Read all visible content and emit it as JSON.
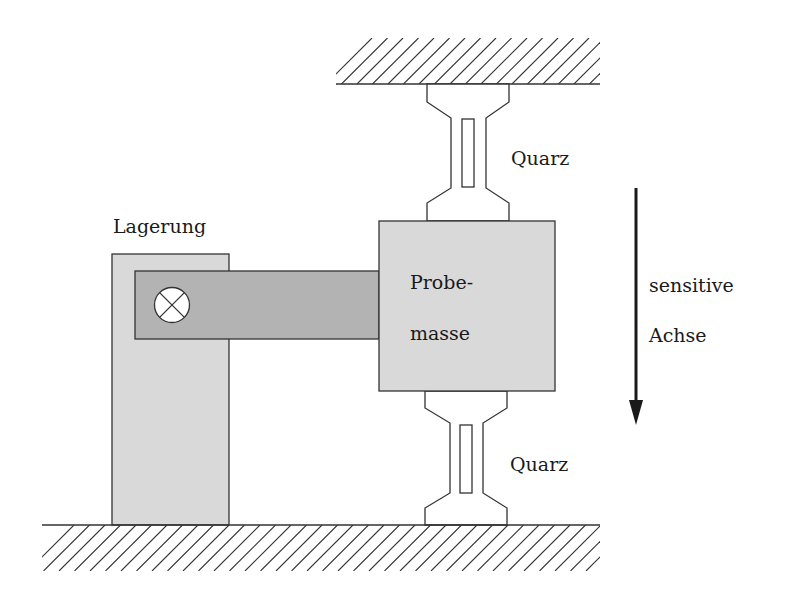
{
  "diagram": {
    "type": "mechanical-schematic",
    "labels": {
      "bearing": "Lagerung",
      "proof_mass_line1": "Probe-",
      "proof_mass_line2": "masse",
      "quartz_upper": "Quarz",
      "quartz_lower": "Quarz",
      "axis_line1": "sensitive",
      "axis_line2": "Achse"
    },
    "components": [
      {
        "id": "ceiling",
        "kind": "fixed-ground",
        "position": "top"
      },
      {
        "id": "floor",
        "kind": "fixed-ground",
        "position": "bottom"
      },
      {
        "id": "bearing",
        "label": "Lagerung",
        "kind": "support-block"
      },
      {
        "id": "pivot",
        "kind": "hinge",
        "symbol": "circle-with-x"
      },
      {
        "id": "arm",
        "kind": "pendulum-arm"
      },
      {
        "id": "proof-mass",
        "label": "Probemasse",
        "kind": "mass-block"
      },
      {
        "id": "quartz-upper",
        "label": "Quarz",
        "kind": "quartz-resonator"
      },
      {
        "id": "quartz-lower",
        "label": "Quarz",
        "kind": "quartz-resonator"
      },
      {
        "id": "sensitive-axis",
        "label": "sensitive Achse",
        "kind": "arrow",
        "direction": "down"
      }
    ],
    "colors": {
      "light_fill": "#d9d9d9",
      "arm_fill": "#b3b3b3",
      "quartz_fill": "#ffffff",
      "stroke": "#333333",
      "arrow": "#1a1a1a"
    }
  }
}
